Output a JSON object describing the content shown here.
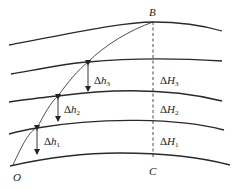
{
  "diagram": {
    "points": {
      "B": "B",
      "O": "O",
      "C": "C"
    },
    "left_labels": [
      {
        "delta": "Δ",
        "var": "h",
        "sub": "3"
      },
      {
        "delta": "Δ",
        "var": "h",
        "sub": "2"
      },
      {
        "delta": "Δ",
        "var": "h",
        "sub": "1"
      }
    ],
    "right_labels": [
      {
        "delta": "Δ",
        "var": "H",
        "sub": "3"
      },
      {
        "delta": "Δ",
        "var": "H",
        "sub": "2"
      },
      {
        "delta": "Δ",
        "var": "H",
        "sub": "1"
      }
    ],
    "colors": {
      "line": "#2a2a2a",
      "background": "#ffffff"
    }
  }
}
